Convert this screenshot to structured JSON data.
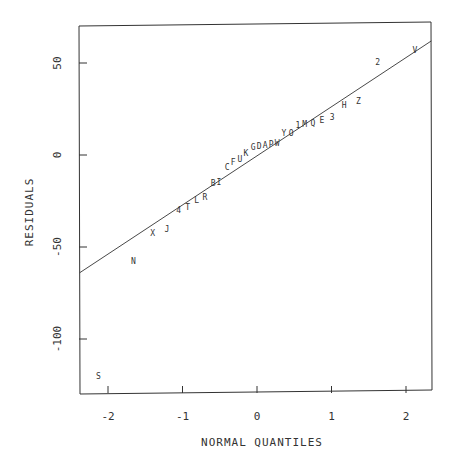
{
  "chart_data": {
    "type": "scatter",
    "title": "",
    "xlabel": "NORMAL QUANTILES",
    "ylabel": "RESIDUALS",
    "xlim": [
      -2.38,
      2.34
    ],
    "ylim": [
      -127,
      72
    ],
    "xticks": [
      -2,
      -1,
      0,
      1,
      2
    ],
    "xtick_labels": [
      "-2",
      "-1",
      "0",
      "1",
      "2"
    ],
    "yticks": [
      50,
      0,
      -50,
      -100
    ],
    "ytick_labels": [
      "50",
      "0",
      "-50",
      "-100"
    ],
    "grid": false,
    "legend": null,
    "reference_line": {
      "x": [
        -2.38,
        2.34
      ],
      "y": [
        -64,
        62
      ]
    },
    "points": [
      {
        "label": "S",
        "x": -2.13,
        "y": -120
      },
      {
        "label": "N",
        "x": -1.66,
        "y": -57.6
      },
      {
        "label": "X",
        "x": -1.4,
        "y": -42.4
      },
      {
        "label": "J",
        "x": -1.21,
        "y": -40.2
      },
      {
        "label": "4",
        "x": -1.05,
        "y": -29.9
      },
      {
        "label": "T",
        "x": -0.93,
        "y": -28.3
      },
      {
        "label": "L",
        "x": -0.81,
        "y": -24.5
      },
      {
        "label": "R",
        "x": -0.7,
        "y": -22.8
      },
      {
        "label": "B",
        "x": -0.59,
        "y": -15.2
      },
      {
        "label": "I",
        "x": -0.51,
        "y": -14.7
      },
      {
        "label": "C",
        "x": -0.4,
        "y": -6.5
      },
      {
        "label": "F",
        "x": -0.32,
        "y": -3.8
      },
      {
        "label": "U",
        "x": -0.23,
        "y": -2.2
      },
      {
        "label": "K",
        "x": -0.15,
        "y": 1.1
      },
      {
        "label": "G",
        "x": -0.05,
        "y": 4.3
      },
      {
        "label": "D",
        "x": 0.03,
        "y": 4.9
      },
      {
        "label": "A",
        "x": 0.11,
        "y": 5.4
      },
      {
        "label": "P",
        "x": 0.19,
        "y": 6.0
      },
      {
        "label": "W",
        "x": 0.27,
        "y": 6.5
      },
      {
        "label": "Y",
        "x": 0.36,
        "y": 12.0
      },
      {
        "label": "O",
        "x": 0.46,
        "y": 12.0
      },
      {
        "label": "1",
        "x": 0.55,
        "y": 16.3
      },
      {
        "label": "M",
        "x": 0.64,
        "y": 16.8
      },
      {
        "label": "Q",
        "x": 0.75,
        "y": 17.4
      },
      {
        "label": "E",
        "x": 0.87,
        "y": 19.0
      },
      {
        "label": "3",
        "x": 1.01,
        "y": 20.7
      },
      {
        "label": "H",
        "x": 1.17,
        "y": 27.2
      },
      {
        "label": "Z",
        "x": 1.36,
        "y": 29.3
      },
      {
        "label": "2",
        "x": 1.62,
        "y": 50.5
      },
      {
        "label": "V",
        "x": 2.12,
        "y": 57.1
      }
    ]
  },
  "style": {
    "ink_color": "#333333",
    "background": "#ffffff"
  }
}
